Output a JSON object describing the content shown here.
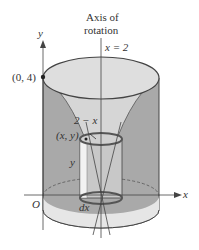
{
  "labels": {
    "axis_title_line1": "Axis of",
    "axis_title_line2": "rotation",
    "axis_eq": "x = 2",
    "y_axis": "y",
    "x_axis": "x",
    "origin": "O",
    "point_top": "(0, 4)",
    "radius": "2 − x",
    "point_xy": "(x, y)",
    "height": "y",
    "thickness": "dx"
  },
  "colors": {
    "outer_fill": "#a9a9a9",
    "inner_fill": "#d4d4d4",
    "top_fill": "#dcdcdc",
    "base_fill": "#e0e0e0",
    "shell_fill": "#bdbdbd",
    "stroke": "#444444"
  }
}
